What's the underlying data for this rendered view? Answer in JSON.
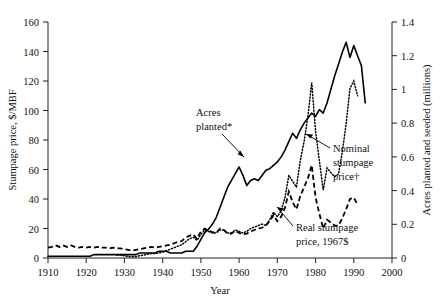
{
  "chart_data": {
    "type": "line",
    "title": "",
    "xlabel": "Year",
    "ylabel": "Stumpage price, $/MBF",
    "y2label": "Acres planted and seeded (millions)",
    "xlim": [
      1910,
      2000
    ],
    "ylim": [
      0,
      160
    ],
    "y2lim": [
      0,
      1.4
    ],
    "xticks": [
      1910,
      1920,
      1930,
      1940,
      1950,
      1960,
      1970,
      1980,
      1990,
      2000
    ],
    "xtick_labels": [
      "1910",
      "1920",
      "1930",
      "1940",
      "1950",
      "1960",
      "1970",
      "1980",
      "1990",
      "2000"
    ],
    "yticks": [
      0,
      20,
      40,
      60,
      80,
      100,
      120,
      140,
      160
    ],
    "ytick_labels": [
      "0",
      "20",
      "40",
      "60",
      "80",
      "100",
      "120",
      "140",
      "160"
    ],
    "y2ticks": [
      0,
      0.2,
      0.4,
      0.6,
      0.8,
      1.0,
      1.2,
      1.4
    ],
    "y2tick_labels": [
      "0",
      "0.2",
      "0.4",
      "0.6",
      "0.8",
      "1",
      "1.2",
      "1.4"
    ],
    "grid": false,
    "legend_position": "inline-annotations",
    "annotations": [
      {
        "id": "acres-planted",
        "text_line1": "Acres",
        "text_line2": "planted*",
        "text": "Acres planted*",
        "x": 196,
        "y": 113,
        "arrow_from_x": 214,
        "arrow_from_y": 131,
        "arrow_to_x": 240,
        "arrow_to_y": 154
      },
      {
        "id": "nominal-stumpage-price",
        "text_line1": "Nominal",
        "text_line2": "stumpage",
        "text_line3": "price†",
        "text": "Nominal stumpage price†",
        "x": 333,
        "y": 150,
        "arrow_from_x": 330,
        "arrow_from_y": 148,
        "arrow_to_x": 304,
        "arrow_to_y": 133
      },
      {
        "id": "real-stumpage-price",
        "text_line1": "Real stumpage",
        "text_line2": "price, 1967$",
        "text": "Real stumpage price, 1967$",
        "x": 295,
        "y": 228,
        "arrow_from_x": 292,
        "arrow_from_y": 224,
        "arrow_to_x": 276,
        "arrow_to_y": 208
      }
    ],
    "series": [
      {
        "name": "Acres planted*",
        "axis": "right",
        "style": "solid",
        "units": "millions of acres",
        "x": [
          1910,
          1911,
          1912,
          1913,
          1914,
          1915,
          1916,
          1917,
          1918,
          1919,
          1920,
          1921,
          1922,
          1923,
          1924,
          1925,
          1926,
          1927,
          1928,
          1929,
          1930,
          1931,
          1932,
          1933,
          1934,
          1935,
          1936,
          1937,
          1938,
          1939,
          1940,
          1941,
          1942,
          1943,
          1944,
          1945,
          1946,
          1947,
          1948,
          1949,
          1950,
          1951,
          1952,
          1953,
          1954,
          1955,
          1956,
          1957,
          1958,
          1959,
          1960,
          1961,
          1962,
          1963,
          1964,
          1965,
          1966,
          1967,
          1968,
          1969,
          1970,
          1971,
          1972,
          1973,
          1974,
          1975,
          1976,
          1977,
          1978,
          1979,
          1980,
          1981,
          1982,
          1983,
          1984,
          1985,
          1986,
          1987,
          1988,
          1989,
          1990,
          1991,
          1992,
          1993
        ],
        "values": [
          0.01,
          0.01,
          0.01,
          0.01,
          0.01,
          0.01,
          0.01,
          0.01,
          0.01,
          0.01,
          0.01,
          0.01,
          0.02,
          0.02,
          0.02,
          0.02,
          0.02,
          0.02,
          0.02,
          0.02,
          0.02,
          0.02,
          0.02,
          0.02,
          0.03,
          0.03,
          0.03,
          0.03,
          0.03,
          0.04,
          0.04,
          0.04,
          0.03,
          0.03,
          0.03,
          0.03,
          0.04,
          0.04,
          0.04,
          0.07,
          0.11,
          0.15,
          0.17,
          0.2,
          0.24,
          0.3,
          0.36,
          0.42,
          0.46,
          0.5,
          0.54,
          0.49,
          0.43,
          0.46,
          0.47,
          0.46,
          0.49,
          0.52,
          0.53,
          0.55,
          0.57,
          0.6,
          0.64,
          0.69,
          0.74,
          0.71,
          0.76,
          0.8,
          0.83,
          0.86,
          0.84,
          0.88,
          0.86,
          0.92,
          1.0,
          1.08,
          1.15,
          1.22,
          1.28,
          1.19,
          1.26,
          1.2,
          1.14,
          0.92
        ]
      },
      {
        "name": "Nominal stumpage price†",
        "axis": "left",
        "style": "dotted",
        "units": "$/MBF",
        "x": [
          1928,
          1929,
          1930,
          1931,
          1932,
          1933,
          1934,
          1935,
          1936,
          1937,
          1938,
          1939,
          1940,
          1941,
          1942,
          1943,
          1944,
          1945,
          1946,
          1947,
          1948,
          1949,
          1950,
          1951,
          1952,
          1953,
          1954,
          1955,
          1956,
          1957,
          1958,
          1959,
          1960,
          1961,
          1962,
          1963,
          1964,
          1965,
          1966,
          1967,
          1968,
          1969,
          1970,
          1971,
          1972,
          1973,
          1974,
          1975,
          1976,
          1977,
          1978,
          1979,
          1980,
          1981,
          1982,
          1983,
          1984,
          1985,
          1986,
          1987,
          1988,
          1989,
          1990,
          1991
        ],
        "values": [
          2.0,
          2.0,
          1.5,
          1.0,
          0.8,
          1.0,
          1.5,
          2.0,
          2.5,
          3.0,
          3.0,
          3.5,
          4.0,
          5.0,
          6.0,
          7.0,
          8.0,
          9.0,
          11.0,
          13.0,
          14.0,
          12.0,
          16.0,
          19.0,
          18.0,
          17.0,
          17.0,
          19.0,
          19.0,
          17.0,
          17.0,
          19.0,
          18.0,
          17.0,
          18.0,
          20.0,
          21.0,
          22.0,
          23.0,
          22.0,
          26.0,
          31.0,
          28.0,
          32.0,
          41.0,
          56.0,
          52.0,
          48.0,
          66.0,
          79.0,
          96.0,
          119.0,
          86.0,
          66.0,
          46.0,
          61.0,
          58.0,
          55.0,
          57.0,
          72.0,
          91.0,
          115.0,
          120.0,
          110.0
        ]
      },
      {
        "name": "Real stumpage price, 1967$",
        "axis": "left",
        "style": "dashed",
        "units": "1967 $/MBF",
        "x": [
          1910,
          1911,
          1912,
          1913,
          1914,
          1915,
          1916,
          1917,
          1918,
          1919,
          1920,
          1921,
          1922,
          1923,
          1924,
          1925,
          1926,
          1927,
          1928,
          1929,
          1930,
          1931,
          1932,
          1933,
          1934,
          1935,
          1936,
          1937,
          1938,
          1939,
          1940,
          1941,
          1942,
          1943,
          1944,
          1945,
          1946,
          1947,
          1948,
          1949,
          1950,
          1951,
          1952,
          1953,
          1954,
          1955,
          1956,
          1957,
          1958,
          1959,
          1960,
          1961,
          1962,
          1963,
          1964,
          1965,
          1966,
          1967,
          1968,
          1969,
          1970,
          1971,
          1972,
          1973,
          1974,
          1975,
          1976,
          1977,
          1978,
          1979,
          1980,
          1981,
          1982,
          1983,
          1984,
          1985,
          1986,
          1987,
          1988,
          1989,
          1990,
          1991
        ],
        "values": [
          7.0,
          7.5,
          8.5,
          7.5,
          8.5,
          7.5,
          8.5,
          7.5,
          7.0,
          7.5,
          7.0,
          7.5,
          7.0,
          7.5,
          7.0,
          7.0,
          6.5,
          7.0,
          6.5,
          6.5,
          6.0,
          5.5,
          5.0,
          5.5,
          6.0,
          6.5,
          7.0,
          7.5,
          7.0,
          7.5,
          8.0,
          8.5,
          9.0,
          10.0,
          11.0,
          11.5,
          14.0,
          15.0,
          16.0,
          13.0,
          18.0,
          20.0,
          18.5,
          17.5,
          17.0,
          20.0,
          19.0,
          16.5,
          16.5,
          18.5,
          17.0,
          16.0,
          16.5,
          18.0,
          19.0,
          20.0,
          20.5,
          22.0,
          25.0,
          29.0,
          25.0,
          28.0,
          34.0,
          45.0,
          38.0,
          33.0,
          42.0,
          48.0,
          54.0,
          63.0,
          41.0,
          30.0,
          20.0,
          26.0,
          24.0,
          22.0,
          22.0,
          27.0,
          33.0,
          40.0,
          41.0,
          36.0
        ]
      }
    ]
  },
  "footnotes": {
    "acres_marker": "*",
    "nominal_marker": "†",
    "real_label": "1967$"
  }
}
